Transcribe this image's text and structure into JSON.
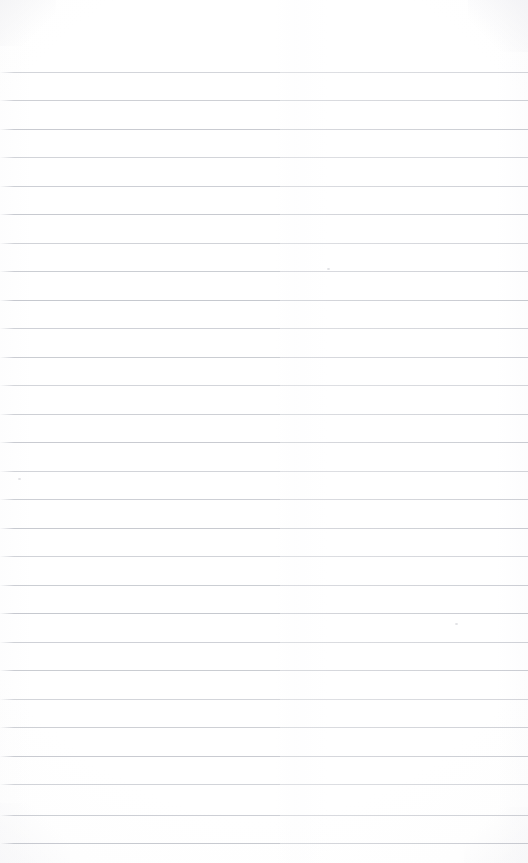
{
  "document": {
    "type": "blank-lined-paper",
    "title": "Blank ruled notebook page",
    "page_width": 528,
    "page_height": 863,
    "background_color": "#fefefe",
    "paper_tone": "#ffffff",
    "content_text": "",
    "written_content": "none"
  },
  "ruling": {
    "line_color": "#b9bcc4",
    "line_thickness_px": 1,
    "line_spacing_px": 28.55,
    "first_line_y": 72,
    "last_line_y": 843,
    "line_count": 28,
    "left_margin_x": 0,
    "right_margin_x": 528,
    "margin_rule": "none",
    "line_y_positions": [
      72,
      100,
      129,
      157,
      186,
      214,
      243,
      271,
      300,
      328,
      357,
      385,
      414,
      442,
      471,
      499,
      528,
      556,
      585,
      613,
      642,
      670,
      699,
      727,
      756,
      784,
      815,
      843
    ]
  },
  "header": {
    "top_blank_area_height": 72,
    "label": ""
  },
  "artifacts": {
    "speck_positions": [
      {
        "x": 18,
        "y": 478
      },
      {
        "x": 327,
        "y": 268
      },
      {
        "x": 455,
        "y": 623
      }
    ],
    "corner_shading": [
      "top-left",
      "top-right",
      "bottom-left",
      "bottom-right"
    ]
  }
}
